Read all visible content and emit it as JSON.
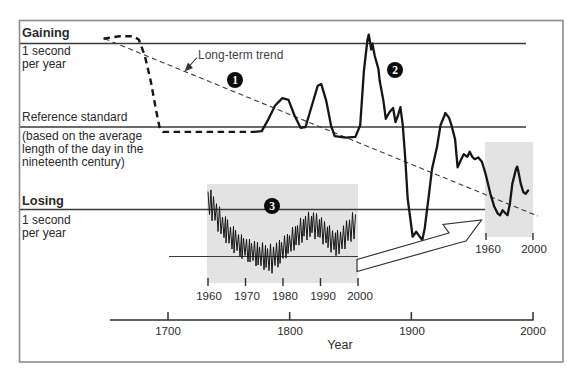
{
  "figure": {
    "left_labels": {
      "gaining": "Gaining",
      "gaining_sub1": "1 second",
      "gaining_sub2": "per year",
      "reference": "Reference standard",
      "reference_note1": "(based on the average",
      "reference_note2": "length of the day in the",
      "reference_note3": "nineteenth century)",
      "losing": "Losing",
      "losing_sub1": "1 second",
      "losing_sub2": "per year"
    },
    "trend_label": "Long-term trend",
    "badges": {
      "b1": "1",
      "b2": "2",
      "b3": "3"
    },
    "axis_title": "Year"
  },
  "colors": {
    "ink": "#161616",
    "line": "#3a3a3a",
    "frame": "#8b8b8b",
    "box_fill": "#e3e3e3",
    "badge_bg": "#0b0b0b",
    "badge_fg": "#ffffff",
    "arrow_stroke": "#333333"
  },
  "chart_data": {
    "type": "line",
    "x_axis": {
      "label": "Year",
      "ticks": [
        1700,
        1800,
        1900,
        2000
      ],
      "range": [
        1650,
        2000
      ]
    },
    "y_axis": {
      "unit": "seconds per year",
      "range": [
        -1.45,
        1.2
      ],
      "guide_lines": {
        "plus_one": "Gaining 1 second per year",
        "zero": "Reference standard (based on the average length of the day in the nineteenth century)",
        "minus_one": "Losing 1 second per year"
      }
    },
    "series": [
      {
        "name": "early-estimate",
        "style": "bold-dashed",
        "points": [
          [
            1647,
            1.07
          ],
          [
            1660,
            1.1
          ],
          [
            1671,
            1.1
          ],
          [
            1676,
            1.06
          ],
          [
            1681,
            0.86
          ],
          [
            1686,
            0.54
          ],
          [
            1690,
            0.22
          ],
          [
            1693,
            0
          ],
          [
            1696,
            -0.06
          ],
          [
            1730,
            -0.06
          ],
          [
            1771,
            -0.06
          ]
        ]
      },
      {
        "name": "observed",
        "style": "solid",
        "points": [
          [
            1771,
            -0.06
          ],
          [
            1777,
            -0.05
          ],
          [
            1782,
            0.08
          ],
          [
            1788,
            0.26
          ],
          [
            1794,
            0.35
          ],
          [
            1799,
            0.33
          ],
          [
            1804,
            0.14
          ],
          [
            1809,
            -0.01
          ],
          [
            1813,
            0
          ],
          [
            1817,
            0.2
          ],
          [
            1823,
            0.5
          ],
          [
            1826,
            0.52
          ],
          [
            1830,
            0.32
          ],
          [
            1834,
            0.02
          ],
          [
            1837,
            -0.11
          ],
          [
            1846,
            -0.13
          ],
          [
            1854,
            -0.12
          ],
          [
            1858,
            0.02
          ],
          [
            1861,
            0.68
          ],
          [
            1864,
            1.06
          ],
          [
            1865,
            1.12
          ],
          [
            1867,
            0.94
          ],
          [
            1868,
            1.01
          ],
          [
            1870,
            0.86
          ],
          [
            1873,
            0.7
          ],
          [
            1874,
            0.56
          ],
          [
            1877,
            0.32
          ],
          [
            1879,
            0.1
          ],
          [
            1882,
            0.18
          ],
          [
            1885,
            0.23
          ],
          [
            1887,
            0.06
          ],
          [
            1889,
            0.14
          ],
          [
            1891,
            0.24
          ],
          [
            1893,
            0.02
          ],
          [
            1895,
            -0.39
          ],
          [
            1897,
            -0.87
          ],
          [
            1900,
            -1.2
          ],
          [
            1901,
            -1.33
          ],
          [
            1904,
            -1.27
          ],
          [
            1906,
            -1.31
          ],
          [
            1909,
            -1.37
          ],
          [
            1911,
            -1.23
          ],
          [
            1914,
            -0.87
          ],
          [
            1917,
            -0.51
          ],
          [
            1921,
            -0.25
          ],
          [
            1924,
            0.02
          ],
          [
            1927,
            0.13
          ],
          [
            1928,
            0.17
          ],
          [
            1931,
            0.11
          ],
          [
            1933,
            0.02
          ],
          [
            1936,
            -0.15
          ],
          [
            1938,
            -0.49
          ],
          [
            1941,
            -0.39
          ],
          [
            1943,
            -0.33
          ],
          [
            1946,
            -0.36
          ],
          [
            1948,
            -0.3
          ],
          [
            1950,
            -0.36
          ],
          [
            1952,
            -0.39
          ],
          [
            1955,
            -0.37
          ],
          [
            1958,
            -0.42
          ],
          [
            1961,
            -0.57
          ],
          [
            1965,
            -0.81
          ],
          [
            1968,
            -0.96
          ],
          [
            1971,
            -1.05
          ],
          [
            1973,
            -1.07
          ],
          [
            1975,
            -1.01
          ],
          [
            1977,
            -1.04
          ],
          [
            1979,
            -1.07
          ],
          [
            1981,
            -0.93
          ],
          [
            1983,
            -0.69
          ],
          [
            1986,
            -0.51
          ],
          [
            1987,
            -0.48
          ],
          [
            1988,
            -0.54
          ],
          [
            1990,
            -0.69
          ],
          [
            1992,
            -0.79
          ],
          [
            1994,
            -0.81
          ],
          [
            1996,
            -0.77
          ]
        ]
      },
      {
        "name": "long-term-trend",
        "style": "thin-dashed",
        "points": [
          [
            1648,
            1.07
          ],
          [
            2004,
            -1.08
          ]
        ]
      }
    ],
    "inset": {
      "description": "Detail of seasonal fluctuations, 1960-2000",
      "x_ticks": [
        1960,
        1970,
        1980,
        1990,
        2000
      ],
      "envelope_px": [
        [
          208,
          200,
          14
        ],
        [
          212,
          206,
          15
        ],
        [
          218,
          218,
          14
        ],
        [
          226,
          230,
          13
        ],
        [
          234,
          240,
          13
        ],
        [
          242,
          247,
          12
        ],
        [
          250,
          251,
          12
        ],
        [
          258,
          254,
          13
        ],
        [
          266,
          257,
          14
        ],
        [
          272,
          259,
          15
        ],
        [
          280,
          252,
          13
        ],
        [
          288,
          244,
          12
        ],
        [
          296,
          236,
          13
        ],
        [
          304,
          228,
          14
        ],
        [
          312,
          224,
          14
        ],
        [
          320,
          228,
          13
        ],
        [
          328,
          237,
          13
        ],
        [
          336,
          244,
          13
        ],
        [
          342,
          240,
          13
        ],
        [
          348,
          231,
          14
        ],
        [
          356,
          224,
          15
        ]
      ]
    },
    "detail": {
      "description": "Highlighted 1960-2000 portion of main curve",
      "x_ticks": [
        1960,
        2000
      ]
    },
    "pixel_mapping": {
      "x_at_1700": 168,
      "px_per_year": 1.2167,
      "y_at_zero": 127,
      "px_per_unit": 82.5
    }
  }
}
